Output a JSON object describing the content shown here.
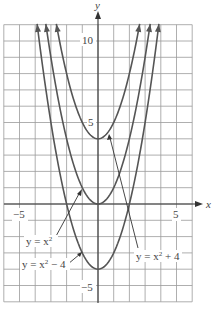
{
  "chart_data": {
    "type": "line",
    "title": "",
    "xlabel": "x",
    "ylabel": "y",
    "xlim": [
      -6,
      6
    ],
    "ylim": [
      -6,
      11
    ],
    "grid": true,
    "x_ticks_labeled": [
      {
        "value": -5,
        "label": "−5"
      },
      {
        "value": 5,
        "label": "5"
      }
    ],
    "y_ticks_labeled": [
      {
        "value": 10,
        "label": "10"
      },
      {
        "value": 5,
        "label": "5"
      },
      {
        "value": -5,
        "label": "−5"
      }
    ],
    "series": [
      {
        "name": "y = x² + 4",
        "shift": 4,
        "vertex": [
          0,
          4
        ]
      },
      {
        "name": "y = x²",
        "shift": 0,
        "vertex": [
          0,
          0
        ]
      },
      {
        "name": "y = x² − 4",
        "shift": -4,
        "vertex": [
          0,
          -4
        ]
      }
    ],
    "annotations": [
      {
        "text": "y = x²",
        "points_to_series": "y = x²"
      },
      {
        "text": "y = x² − 4",
        "points_to_series": "y = x² − 4"
      },
      {
        "text": "y = x² + 4",
        "points_to_series": "y = x² + 4"
      }
    ]
  },
  "labels": {
    "x_axis": "x",
    "y_axis": "y",
    "x_neg5": "−5",
    "x_pos5": "5",
    "y_10": "10",
    "y_5": "5",
    "y_neg5": "−5",
    "ann_x2": "y = x",
    "ann_x2m4": "y = x",
    "ann_x2p4": "y = x",
    "sup": "2",
    "ann_x2m4_tail": " − 4",
    "ann_x2p4_tail": " + 4"
  },
  "colors": {
    "grid": "#9a9a9a",
    "curve": "#555555",
    "axis": "#333333",
    "text": "#444444"
  }
}
